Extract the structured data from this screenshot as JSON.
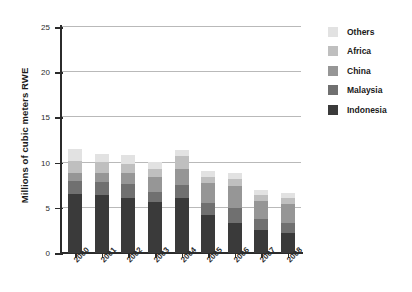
{
  "chart_data": {
    "type": "bar",
    "stacked": true,
    "title": "",
    "subtitle": "",
    "xlabel": "",
    "ylabel": "Millions of cubic meters RWE",
    "ylim": [
      0,
      25
    ],
    "yticks": [
      0,
      5,
      10,
      15,
      20,
      25
    ],
    "ytick_labels": [
      "0",
      "5",
      "10",
      "15",
      "20",
      "25"
    ],
    "grid": true,
    "grid_axis": "y",
    "legend_position": "right",
    "categories": [
      "2000",
      "2001",
      "2002",
      "2003",
      "2004",
      "2005",
      "2006",
      "2007",
      "2008"
    ],
    "series": [
      {
        "name": "Indonesia",
        "color": "#3a3a3a",
        "values": [
          6.5,
          6.4,
          6.1,
          5.6,
          6.1,
          4.2,
          3.3,
          2.5,
          2.2
        ]
      },
      {
        "name": "Malaysia",
        "color": "#707070",
        "values": [
          1.5,
          1.5,
          1.5,
          1.2,
          1.4,
          1.3,
          1.7,
          1.3,
          1.1
        ]
      },
      {
        "name": "China",
        "color": "#969696",
        "values": [
          0.9,
          1.0,
          1.3,
          1.6,
          1.8,
          2.2,
          2.4,
          2.0,
          2.1
        ]
      },
      {
        "name": "Africa",
        "color": "#bfbfbf",
        "values": [
          1.3,
          1.2,
          1.0,
          0.9,
          1.4,
          0.7,
          0.8,
          0.6,
          0.7
        ]
      },
      {
        "name": "Others",
        "color": "#e2e2e2",
        "values": [
          1.3,
          0.8,
          0.9,
          0.8,
          0.7,
          0.7,
          0.7,
          0.6,
          0.5
        ]
      }
    ],
    "totals": [
      11.5,
      10.9,
      10.8,
      10.1,
      11.4,
      9.1,
      8.9,
      7.0,
      6.6
    ]
  },
  "legend": {
    "entries": [
      {
        "label": "Others",
        "color": "#e2e2e2"
      },
      {
        "label": "Africa",
        "color": "#bfbfbf"
      },
      {
        "label": "China",
        "color": "#969696"
      },
      {
        "label": "Malaysia",
        "color": "#707070"
      },
      {
        "label": "Indonesia",
        "color": "#3a3a3a"
      }
    ]
  },
  "axes": {
    "y_title": "Millions of cubic meters RWE"
  }
}
